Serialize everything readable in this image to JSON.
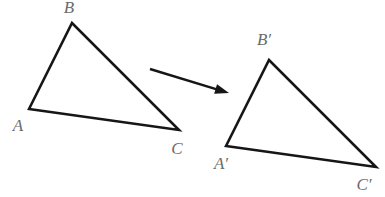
{
  "figure": {
    "background_color": "#ffffff",
    "stroke_color": "#161616",
    "label_color": "#6b6b6b"
  },
  "chart_data": {
    "type": "diagram",
    "title": "",
    "grid": false,
    "legend": null,
    "shapes": [
      {
        "name": "triangle-abc",
        "kind": "triangle",
        "closed": true,
        "vertices": [
          {
            "label": "A",
            "x": 29,
            "y": 109
          },
          {
            "label": "B",
            "x": 72,
            "y": 23
          },
          {
            "label": "C",
            "x": 179,
            "y": 130
          }
        ]
      },
      {
        "name": "triangle-a-prime-b-prime-c-prime",
        "kind": "triangle",
        "closed": true,
        "vertices": [
          {
            "label": "A′",
            "x": 226,
            "y": 146
          },
          {
            "label": "B′",
            "x": 269,
            "y": 60
          },
          {
            "label": "C′",
            "x": 376,
            "y": 167
          }
        ]
      }
    ],
    "arrow": {
      "name": "translation-arrow",
      "from": {
        "x": 150,
        "y": 69
      },
      "to": {
        "x": 229,
        "y": 93
      },
      "head_length": 14,
      "head_width": 10
    }
  },
  "labels": {
    "a": {
      "text": "A",
      "x": 18,
      "y": 127
    },
    "b": {
      "text": "B",
      "x": 69,
      "y": 9
    },
    "c": {
      "text": "C",
      "x": 177,
      "y": 150
    },
    "a_prime": {
      "text": "A′",
      "x": 221,
      "y": 165
    },
    "b_prime": {
      "text": "B′",
      "x": 264,
      "y": 41
    },
    "c_prime": {
      "text": "C′",
      "x": 364,
      "y": 186
    }
  }
}
